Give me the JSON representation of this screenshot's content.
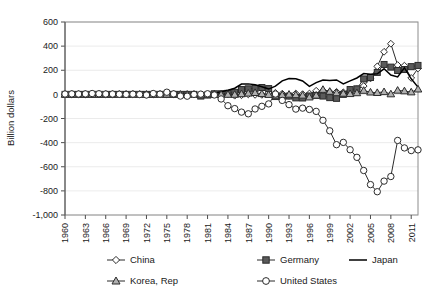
{
  "chart_data": {
    "type": "line",
    "title": "",
    "xlabel": "",
    "ylabel": "Billion dollars",
    "ylim": [
      -1000,
      600
    ],
    "ytick_step": 200,
    "ytick_labels": [
      "600",
      "400",
      "200",
      "0",
      "-200",
      "-400",
      "-600",
      "-800",
      "-1,000"
    ],
    "ytick_values": [
      600,
      400,
      200,
      0,
      -200,
      -400,
      -600,
      -800,
      -1000
    ],
    "grid": true,
    "legend_position": "bottom",
    "xlim": [
      1960,
      2012
    ],
    "xtick_labels": [
      "1960",
      "1963",
      "1966",
      "1969",
      "1972",
      "1975",
      "1978",
      "1981",
      "1984",
      "1987",
      "1990",
      "1993",
      "1996",
      "1999",
      "2002",
      "2005",
      "2008",
      "2011"
    ],
    "x": [
      1960,
      1961,
      1962,
      1963,
      1964,
      1965,
      1966,
      1967,
      1968,
      1969,
      1970,
      1971,
      1972,
      1973,
      1974,
      1975,
      1976,
      1977,
      1978,
      1979,
      1980,
      1981,
      1982,
      1983,
      1984,
      1985,
      1986,
      1987,
      1988,
      1989,
      1990,
      1991,
      1992,
      1993,
      1994,
      1995,
      1996,
      1997,
      1998,
      1999,
      2000,
      2001,
      2002,
      2003,
      2004,
      2005,
      2006,
      2007,
      2008,
      2009,
      2010,
      2011,
      2012
    ],
    "series": [
      {
        "name": "China",
        "marker": "open-diamond",
        "values": [
          0,
          0,
          0,
          0,
          0,
          0,
          0,
          0,
          0,
          0,
          0,
          0,
          0,
          0,
          0,
          0,
          0,
          0,
          0,
          0,
          0,
          0,
          5,
          4,
          2,
          -11,
          -7,
          0,
          -4,
          -4,
          12,
          13,
          6,
          -12,
          7,
          2,
          7,
          30,
          31,
          21,
          21,
          17,
          35,
          43,
          69,
          132,
          232,
          353,
          420,
          243,
          238,
          136,
          215
        ]
      },
      {
        "name": "Germany",
        "marker": "filled-square",
        "values": [
          0,
          0,
          0,
          0,
          0,
          0,
          0,
          0,
          0,
          0,
          0,
          0,
          0,
          0,
          0,
          0,
          0,
          0,
          0,
          0,
          -14,
          -5,
          5,
          5,
          9,
          17,
          40,
          46,
          50,
          57,
          48,
          -18,
          -19,
          -14,
          -29,
          -30,
          -13,
          -9,
          -14,
          -27,
          -33,
          0,
          40,
          46,
          128,
          140,
          182,
          248,
          226,
          198,
          206,
          230,
          240
        ]
      },
      {
        "name": "Japan",
        "marker": "none",
        "values": [
          0,
          0,
          0,
          0,
          0,
          0,
          0,
          0,
          0,
          0,
          0,
          0,
          0,
          0,
          0,
          0,
          0,
          0,
          0,
          0,
          -11,
          5,
          7,
          21,
          35,
          51,
          86,
          87,
          80,
          63,
          44,
          68,
          112,
          132,
          130,
          111,
          66,
          97,
          119,
          115,
          120,
          87,
          112,
          136,
          172,
          166,
          171,
          212,
          160,
          145,
          221,
          129,
          60
        ]
      },
      {
        "name": "Korea, Rep",
        "marker": "open-triangle",
        "values": [
          0,
          0,
          0,
          0,
          0,
          0,
          0,
          0,
          0,
          0,
          0,
          0,
          0,
          0,
          0,
          0,
          0,
          0,
          0,
          0,
          -5,
          -4,
          -2,
          -1,
          -1,
          -1,
          4,
          9,
          14,
          5,
          -2,
          -8,
          -4,
          0,
          -4,
          -8,
          -23,
          -8,
          40,
          24,
          12,
          8,
          5,
          12,
          32,
          18,
          14,
          21,
          3,
          33,
          28,
          19,
          43
        ]
      },
      {
        "name": "United States",
        "marker": "open-circle",
        "values": [
          3,
          4,
          3,
          4,
          7,
          5,
          3,
          3,
          1,
          0,
          2,
          -1,
          -5,
          7,
          2,
          18,
          4,
          -14,
          -15,
          0,
          2,
          5,
          -5,
          -38,
          -94,
          -118,
          -147,
          -161,
          -121,
          -99,
          -79,
          3,
          -50,
          -85,
          -122,
          -114,
          -125,
          -141,
          -215,
          -302,
          -417,
          -398,
          -459,
          -522,
          -631,
          -748,
          -807,
          -719,
          -681,
          -382,
          -444,
          -466,
          -460
        ]
      }
    ]
  },
  "legend": {
    "entries": [
      {
        "label": "China",
        "marker": "open-diamond"
      },
      {
        "label": "Germany",
        "marker": "filled-square"
      },
      {
        "label": "Japan",
        "marker": "none"
      },
      {
        "label": "Korea, Rep",
        "marker": "open-triangle"
      },
      {
        "label": "United States",
        "marker": "open-circle"
      }
    ]
  }
}
